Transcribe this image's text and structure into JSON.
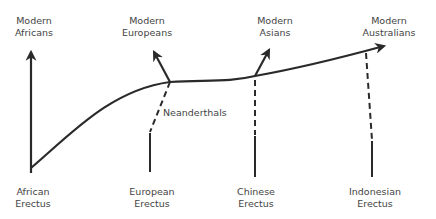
{
  "diagram": {
    "type": "phylogenetic-tree",
    "colors": {
      "line": "#2a2a2a",
      "text": "#444444",
      "background": "#ffffff"
    },
    "top_labels": [
      {
        "id": "modern-africans",
        "line1": "Modern",
        "line2": "Africans"
      },
      {
        "id": "modern-europeans",
        "line1": "Modern",
        "line2": "Europeans"
      },
      {
        "id": "modern-asians",
        "line1": "Modern",
        "line2": "Asians"
      },
      {
        "id": "modern-australians",
        "line1": "Modern",
        "line2": "Australians"
      }
    ],
    "bottom_labels": [
      {
        "id": "african-erectus",
        "line1": "African",
        "line2": "Erectus"
      },
      {
        "id": "european-erectus",
        "line1": "European",
        "line2": "Erectus"
      },
      {
        "id": "chinese-erectus",
        "line1": "Chinese",
        "line2": "Erectus"
      },
      {
        "id": "indonesian-erectus",
        "line1": "Indonesian",
        "line2": "Erectus"
      }
    ],
    "annotations": [
      {
        "id": "neanderthals",
        "text": "Neanderthals"
      }
    ],
    "line_styles": {
      "solid": "continuous lineage",
      "dashed": "admixture / partial contribution"
    }
  }
}
